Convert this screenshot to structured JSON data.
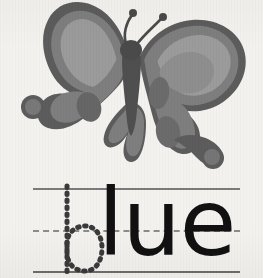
{
  "card": {
    "type": "flashcard",
    "background_color": "#f3f2ef",
    "width": 263,
    "height": 278
  },
  "illustration": {
    "name": "butterfly",
    "alt_text": "butterfly",
    "style": "grayscale cartoon clip art",
    "colors": {
      "outline": "#5c5c5c",
      "wing_fill": "#7e7e7e",
      "wing_highlight": "#9a9a9a",
      "wing_spot": "#6b6b6b",
      "body": "#4a4a4a"
    }
  },
  "practice": {
    "word": "blue",
    "trace_letter": "b",
    "written_letters": "lue",
    "trace_style": "dotted",
    "written_color": "#111111",
    "guidelines": [
      {
        "id": "top",
        "style": "solid",
        "color": "#7b7b7b"
      },
      {
        "id": "middle",
        "style": "dashed",
        "color": "#8c8c8c"
      },
      {
        "id": "bottom",
        "style": "solid",
        "color": "#6e6e6e"
      }
    ]
  }
}
